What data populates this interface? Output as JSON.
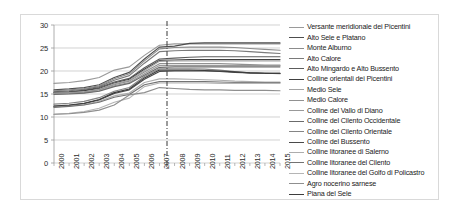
{
  "chart_data": {
    "type": "line",
    "title": "",
    "xlabel": "",
    "ylabel": "",
    "xlim": [
      2000,
      2015
    ],
    "ylim": [
      0,
      30
    ],
    "yticks": [
      0,
      5,
      10,
      15,
      20,
      25,
      30
    ],
    "grid": true,
    "legend_position": "right",
    "x": [
      2000,
      2001,
      2002,
      2003,
      2004,
      2005,
      2006,
      2007,
      2008,
      2009,
      2010,
      2011,
      2012,
      2013,
      2014,
      2015
    ],
    "annotations": [
      {
        "type": "vertical-dashed-line",
        "x": 2007.5,
        "style": "dash-dot",
        "color": "#4a4a4a"
      }
    ],
    "series": [
      {
        "name": "Versante meridionale dei Picentini",
        "color": "#9a9a9a",
        "values": [
          17.3,
          17.5,
          17.9,
          18.6,
          20.2,
          20.9,
          23.4,
          25.6,
          25.9,
          25.9,
          25.9,
          25.9,
          25.9,
          25.9,
          25.9,
          25.9
        ]
      },
      {
        "name": "Alto Sele e Platano",
        "color": "#4d4d4d",
        "values": [
          15.9,
          16.1,
          16.4,
          17.0,
          18.6,
          19.7,
          22.6,
          25.2,
          25.4,
          26.0,
          26.1,
          26.1,
          26.1,
          26.1,
          26.1,
          26.1
        ]
      },
      {
        "name": "Monte Alburno",
        "color": "#8c8c8c",
        "values": [
          15.7,
          15.9,
          16.2,
          16.8,
          18.3,
          19.4,
          22.2,
          24.8,
          25.1,
          25.2,
          25.2,
          25.2,
          25.1,
          24.9,
          24.7,
          24.5
        ]
      },
      {
        "name": "Alto Calore",
        "color": "#7a7a7a",
        "values": [
          15.5,
          15.7,
          16.0,
          16.6,
          18.0,
          19.0,
          21.7,
          24.2,
          24.4,
          24.5,
          24.5,
          24.5,
          24.4,
          24.2,
          24.0,
          23.8
        ]
      },
      {
        "name": "Alto Mingardo e Alto Bussento",
        "color": "#5c5c5c",
        "values": [
          15.4,
          15.5,
          15.8,
          16.4,
          17.6,
          18.4,
          20.7,
          22.6,
          22.8,
          23.0,
          23.1,
          23.1,
          23.1,
          23.1,
          23.1,
          23.1
        ]
      },
      {
        "name": "Colline orientali dei Picentini",
        "color": "#404040",
        "values": [
          15.3,
          15.4,
          15.7,
          16.2,
          17.4,
          18.2,
          20.4,
          22.3,
          22.4,
          22.5,
          22.5,
          22.5,
          22.5,
          22.5,
          22.5,
          22.5
        ]
      },
      {
        "name": "Medio Sele",
        "color": "#a3a3a3",
        "values": [
          15.2,
          15.3,
          15.5,
          16.0,
          17.2,
          18.0,
          20.1,
          22.1,
          22.2,
          22.2,
          22.2,
          22.2,
          22.2,
          22.2,
          22.2,
          22.2
        ]
      },
      {
        "name": "Medio Calore",
        "color": "#919191",
        "values": [
          15.1,
          15.2,
          15.4,
          15.9,
          17.0,
          17.8,
          19.8,
          21.6,
          21.6,
          21.6,
          21.6,
          21.6,
          21.5,
          21.4,
          21.3,
          21.3
        ]
      },
      {
        "name": "Colline del Vallo di Diano",
        "color": "#999999",
        "values": [
          15.0,
          15.1,
          15.3,
          15.7,
          16.8,
          17.5,
          19.4,
          21.2,
          21.2,
          21.2,
          21.2,
          21.2,
          21.2,
          21.2,
          21.2,
          21.2
        ]
      },
      {
        "name": "Colline del Cilento Occidentale",
        "color": "#6b6b6b",
        "values": [
          14.9,
          15.0,
          15.2,
          15.6,
          16.6,
          17.3,
          19.1,
          20.8,
          20.9,
          20.9,
          20.9,
          20.9,
          20.9,
          20.9,
          20.9,
          20.9
        ]
      },
      {
        "name": "Colline del Cilento Orientale",
        "color": "#858585",
        "values": [
          12.8,
          13.0,
          13.4,
          14.2,
          15.6,
          16.4,
          18.8,
          20.5,
          20.5,
          20.5,
          20.4,
          20.2,
          19.9,
          19.6,
          19.5,
          19.4
        ]
      },
      {
        "name": "Colline del Bussento",
        "color": "#4a4a4a",
        "values": [
          12.3,
          12.5,
          12.9,
          13.7,
          15.1,
          15.9,
          18.2,
          19.9,
          20.0,
          20.0,
          20.0,
          19.9,
          19.7,
          19.6,
          19.5,
          19.5
        ]
      },
      {
        "name": "Colline litoranee di Salerno",
        "color": "#adadad",
        "values": [
          12.2,
          12.4,
          12.7,
          13.4,
          14.6,
          15.2,
          17.5,
          18.3,
          18.3,
          18.2,
          18.1,
          18.0,
          17.8,
          17.7,
          17.6,
          17.6
        ]
      },
      {
        "name": "Colline litoranee del Cilento",
        "color": "#737373",
        "values": [
          12.1,
          12.3,
          12.6,
          13.2,
          14.3,
          14.9,
          17.0,
          17.7,
          17.7,
          17.7,
          17.7,
          17.6,
          17.5,
          17.5,
          17.5,
          17.5
        ]
      },
      {
        "name": "Colline litoranee del Golfo di Policastro",
        "color": "#b5b5b5",
        "values": [
          10.6,
          10.8,
          11.2,
          11.9,
          13.2,
          14.1,
          16.6,
          17.4,
          17.4,
          17.4,
          17.4,
          17.3,
          17.3,
          17.3,
          17.3,
          17.3
        ]
      },
      {
        "name": "Agro nocerino sarnese",
        "color": "#8f8f8f",
        "values": [
          10.6,
          10.7,
          11.0,
          11.5,
          12.6,
          14.8,
          15.3,
          16.4,
          16.2,
          16.0,
          15.9,
          15.9,
          15.8,
          15.8,
          15.8,
          15.7
        ]
      },
      {
        "name": "Piana del Sele",
        "color": "#3d3d3d",
        "values": [
          12.4,
          12.6,
          13.0,
          13.8,
          15.3,
          16.1,
          18.5,
          20.2,
          20.2,
          20.2,
          20.1,
          20.0,
          19.8,
          19.6,
          19.5,
          19.5
        ]
      }
    ]
  },
  "axis": {
    "ytick_labels": [
      "30",
      "25",
      "20",
      "15",
      "10",
      "5",
      "0"
    ],
    "xtick_labels": [
      "2000",
      "2001",
      "2002",
      "2003",
      "2004",
      "2005",
      "2006",
      "2007",
      "2008",
      "2009",
      "2010",
      "2011",
      "2012",
      "2013",
      "2014",
      "2015"
    ]
  }
}
